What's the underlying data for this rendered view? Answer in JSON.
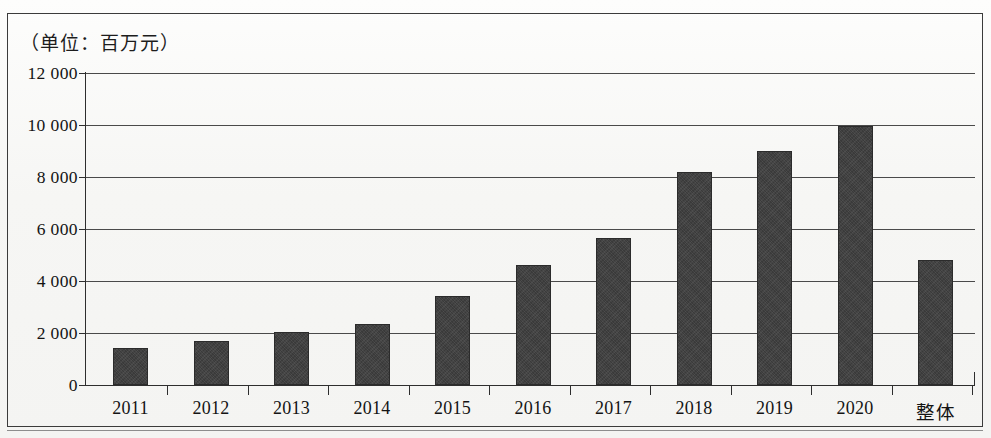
{
  "figure": {
    "title": "（单位：百万元）",
    "bar_color": "#3a3a3a",
    "axis_color": "#2e2e2e",
    "background": "#f7f7f5"
  },
  "chart_data": {
    "type": "bar",
    "title": "（单位：百万元）",
    "xlabel": "",
    "ylabel": "",
    "unit": "百万元",
    "categories": [
      "2011",
      "2012",
      "2013",
      "2014",
      "2015",
      "2016",
      "2017",
      "2018",
      "2019",
      "2020",
      "整体"
    ],
    "values": [
      1430,
      1690,
      2020,
      2350,
      3430,
      4620,
      5650,
      8180,
      9010,
      9960,
      4820
    ],
    "ylim": [
      0,
      12000
    ],
    "ytick_values": [
      12000,
      10000,
      8000,
      6000,
      4000,
      2000,
      0
    ],
    "ytick_labels": [
      "12 000",
      "10 000",
      "8 000",
      "6 000",
      "4 000",
      "2 000",
      "0"
    ],
    "grid": true,
    "legend": null,
    "legend_position": "none"
  }
}
